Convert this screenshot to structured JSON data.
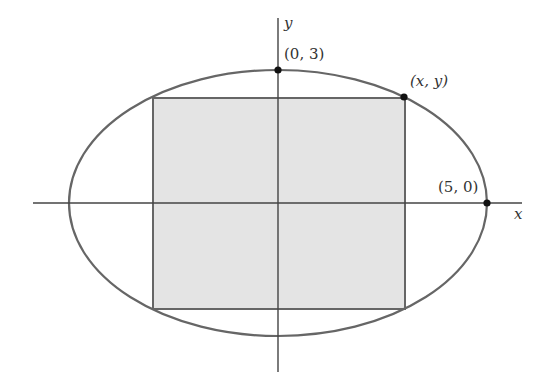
{
  "diagram": {
    "type": "rectangle inscribed in ellipse",
    "axes": {
      "x_label": "x",
      "y_label": "y"
    },
    "points": [
      {
        "id": "top",
        "label": "(0, 3)",
        "x": 0,
        "y": 3
      },
      {
        "id": "corner",
        "label": "(x, y)"
      },
      {
        "id": "right",
        "label": "(5, 0)",
        "x": 5,
        "y": 0
      }
    ],
    "ellipse": {
      "a": 5,
      "b": 3
    },
    "colors": {
      "ellipse_stroke": "#666666",
      "axis_stroke": "#444444",
      "rect_fill": "#e4e4e4",
      "rect_stroke": "#666666",
      "point_fill": "#111111"
    }
  }
}
